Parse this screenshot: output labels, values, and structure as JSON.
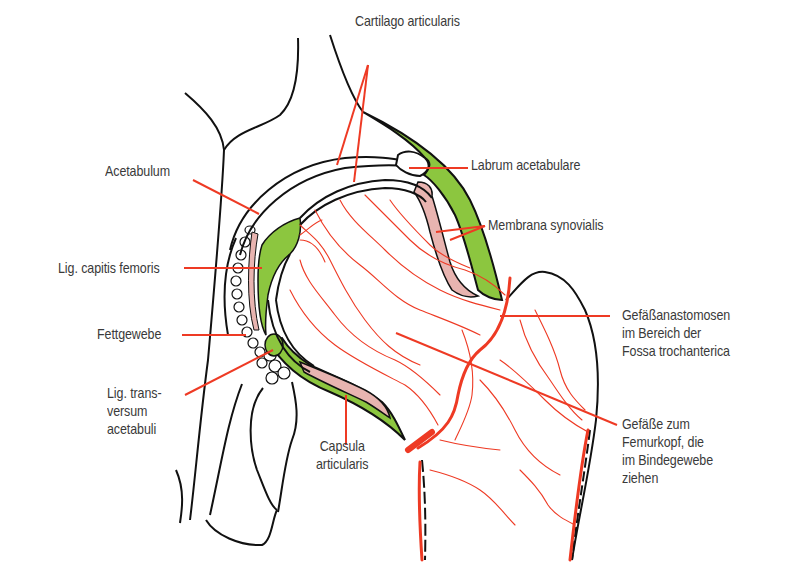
{
  "figure": {
    "colors": {
      "outline": "#111111",
      "vessel": "#ee3a24",
      "leader_line": "#ee3a24",
      "capsule_green": "#8cc63f",
      "synovial_pink": "#e8b4b0",
      "label_text": "#3a3a3a",
      "background": "#ffffff"
    }
  },
  "labels": {
    "cartilago_articularis": "Cartilago articularis",
    "labrum_acetabulare": "Labrum acetabulare",
    "membrana_synovialis": "Membrana synovialis",
    "acetabulum": "Acetabulum",
    "lig_capitis_femoris": "Lig. capitis femoris",
    "fettgewebe": "Fettgewebe",
    "lig_transversum_acetabuli": "Lig. trans-\nversum\nacetabuli",
    "capsula_articularis": "Capsula\narticularis",
    "gefaessanastomosen": "Gefäßanastomosen\nim Bereich der\nFossa trochanterica",
    "gefaesse_zum_femurkopf": "Gefäße zum\nFemurkopf, die\nim Bindegewebe\nziehen"
  }
}
